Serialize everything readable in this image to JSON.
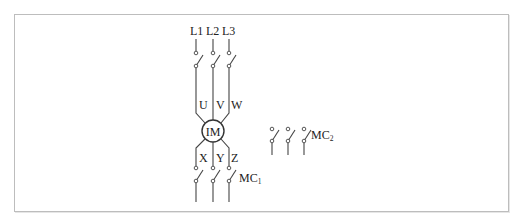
{
  "diagram": {
    "type": "motor wiring schematic",
    "supply_labels": [
      "L1",
      "L2",
      "L3"
    ],
    "motor": {
      "label": "IM"
    },
    "terminal_top_labels": [
      "U",
      "V",
      "W"
    ],
    "terminal_bottom_labels": [
      "X",
      "Y",
      "Z"
    ],
    "contactors": [
      {
        "name": "MC",
        "subscript": "1"
      },
      {
        "name": "MC",
        "subscript": "2"
      }
    ],
    "colors": {
      "line": "#444444",
      "frame": "#bdbdbd",
      "background": "#ffffff"
    }
  }
}
